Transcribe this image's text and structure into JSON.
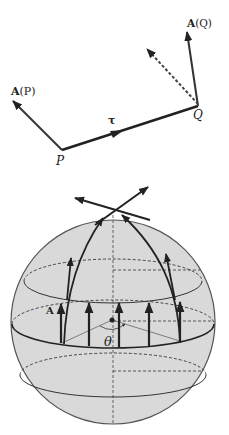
{
  "top_diagram": {
    "labels": {
      "A_P": "A(P)",
      "A_P_bold": "A",
      "A_P_arg": "(P)",
      "A_Q_bold": "A",
      "A_Q_arg": "(Q)",
      "P": "P",
      "Q": "Q",
      "tau": "τ"
    },
    "points": {
      "P": [
        62,
        150
      ],
      "Q": [
        198,
        106
      ]
    },
    "vectors": [
      {
        "name": "A(P)",
        "from": "P",
        "to": [
          12,
          100
        ],
        "style": "solid"
      },
      {
        "name": "tau",
        "from": "P",
        "to": "Q",
        "style": "solid-thick",
        "arrow_mid": true
      },
      {
        "name": "A(Q)",
        "from": "Q",
        "to": [
          187,
          30
        ],
        "style": "solid"
      },
      {
        "name": "A(P) transported",
        "from": "Q",
        "to": [
          145,
          48
        ],
        "style": "dashed"
      }
    ]
  },
  "sphere_diagram": {
    "labels": {
      "A": "A",
      "theta": "θ"
    },
    "sphere": {
      "cx": 113,
      "cy": 322,
      "r": 102,
      "fill": "#d9d9d9"
    },
    "latitude_circles": 3,
    "vertical_arrows_on_circle": 5,
    "meridian_arcs_to_pole": 2
  },
  "colors": {
    "ink": "#222222",
    "sphere_fill": "#d9d9d9",
    "background": "#ffffff"
  }
}
